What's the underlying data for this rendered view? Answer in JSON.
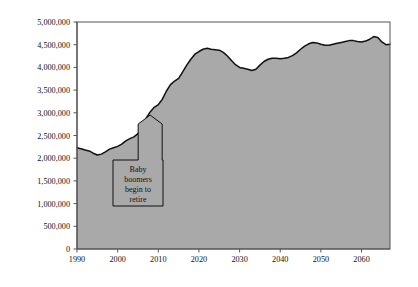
{
  "chart_data": {
    "type": "area",
    "title": "",
    "subtitle": "",
    "xlabel": "",
    "ylabel": "",
    "xlim": [
      1990,
      2067
    ],
    "ylim": [
      0,
      5000000
    ],
    "grid": false,
    "legend": null,
    "fill_color": "#a9a9a9",
    "line_color": "#111111",
    "axis_color": "#555555",
    "background_color": "#ffffff",
    "y_ticks": [
      0,
      500000,
      1000000,
      1500000,
      2000000,
      2500000,
      3000000,
      3500000,
      4000000,
      4500000,
      5000000
    ],
    "y_tick_labels": [
      "0",
      "500,000",
      "1,000,000",
      "1,500,000",
      "2,000,000",
      "2,500,000",
      "3,000,000",
      "3,500,000",
      "4,000,000",
      "4,500,000",
      "5,000,000"
    ],
    "x_ticks": [
      1990,
      2000,
      2010,
      2020,
      2030,
      2040,
      2050,
      2060
    ],
    "x_tick_labels": [
      "1990",
      "2000",
      "2010",
      "2020",
      "2030",
      "2040",
      "2050",
      "2060"
    ],
    "x": [
      1990,
      1991,
      1992,
      1993,
      1994,
      1995,
      1996,
      1997,
      1998,
      1999,
      2000,
      2001,
      2002,
      2003,
      2004,
      2005,
      2006,
      2007,
      2008,
      2009,
      2010,
      2011,
      2012,
      2013,
      2014,
      2015,
      2016,
      2017,
      2018,
      2019,
      2020,
      2021,
      2022,
      2023,
      2024,
      2025,
      2026,
      2027,
      2028,
      2029,
      2030,
      2031,
      2032,
      2033,
      2034,
      2035,
      2036,
      2037,
      2038,
      2039,
      2040,
      2041,
      2042,
      2043,
      2044,
      2045,
      2046,
      2047,
      2048,
      2049,
      2050,
      2051,
      2052,
      2053,
      2054,
      2055,
      2056,
      2057,
      2058,
      2059,
      2060,
      2061,
      2062,
      2063,
      2064,
      2065,
      2066,
      2067
    ],
    "values": [
      2230000,
      2210000,
      2180000,
      2160000,
      2110000,
      2070000,
      2090000,
      2140000,
      2200000,
      2230000,
      2260000,
      2310000,
      2380000,
      2430000,
      2470000,
      2540000,
      2700000,
      2880000,
      3020000,
      3120000,
      3180000,
      3300000,
      3480000,
      3620000,
      3700000,
      3760000,
      3900000,
      4050000,
      4180000,
      4290000,
      4350000,
      4400000,
      4420000,
      4400000,
      4390000,
      4380000,
      4330000,
      4250000,
      4150000,
      4060000,
      4000000,
      3980000,
      3960000,
      3930000,
      3960000,
      4050000,
      4130000,
      4180000,
      4200000,
      4200000,
      4190000,
      4200000,
      4220000,
      4260000,
      4320000,
      4400000,
      4470000,
      4520000,
      4550000,
      4540000,
      4510000,
      4490000,
      4490000,
      4510000,
      4530000,
      4550000,
      4570000,
      4590000,
      4590000,
      4570000,
      4560000,
      4580000,
      4620000,
      4680000,
      4660000,
      4560000,
      4500000,
      4510000
    ],
    "annotations": [
      {
        "text_lines": [
          "Baby",
          "boomers",
          "begin to",
          "retire"
        ],
        "points_to_year": 2008,
        "points_to_value": 2950000,
        "shape": "up-arrow-callout-box"
      }
    ]
  }
}
